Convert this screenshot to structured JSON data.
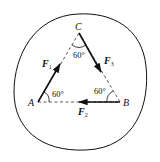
{
  "diagram": {
    "title": "",
    "colors": {
      "line": "#111111",
      "background": "#ffffff"
    },
    "points": {
      "A": {
        "label": "A",
        "x": 38,
        "y": 102
      },
      "B": {
        "label": "B",
        "x": 120,
        "y": 102
      },
      "C": {
        "label": "C",
        "x": 79,
        "y": 33
      }
    },
    "forces": [
      {
        "name": "F1",
        "symbol": "F",
        "subscript": "1",
        "from": "A",
        "direction": "toward C"
      },
      {
        "name": "F2",
        "symbol": "F",
        "subscript": "2",
        "from": "B",
        "direction": "toward A"
      },
      {
        "name": "F3",
        "symbol": "F",
        "subscript": "3",
        "from": "C",
        "direction": "toward B"
      }
    ],
    "angles": {
      "A": "60°",
      "B": "60°",
      "C": "60°"
    },
    "body_outline": "closed curve"
  }
}
